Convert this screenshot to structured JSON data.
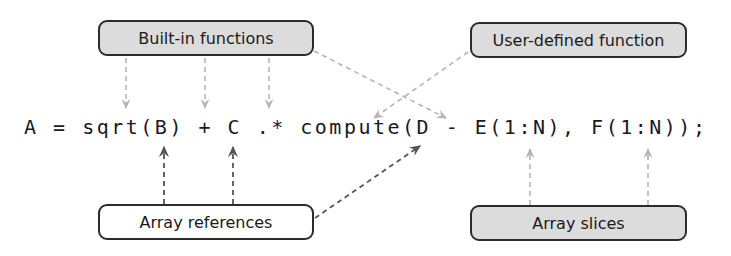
{
  "diagram": {
    "code_line": "A = sqrt(B) + C .* compute(D - E(1:N), F(1:N));",
    "labels": {
      "builtin": "Built-in functions",
      "userdef": "User-defined function",
      "arrayref": "Array references",
      "slices": "Array slices"
    },
    "annotations": [
      {
        "label": "Built-in functions",
        "targets": [
          "sqrt",
          "+",
          ".*",
          "-"
        ],
        "arrow_style": "light-dashed"
      },
      {
        "label": "User-defined function",
        "targets": [
          "compute"
        ],
        "arrow_style": "light-dashed"
      },
      {
        "label": "Array references",
        "targets": [
          "B",
          "C",
          "D"
        ],
        "arrow_style": "dark-dashed"
      },
      {
        "label": "Array slices",
        "targets": [
          "E(1:N)",
          "F(1:N)"
        ],
        "arrow_style": "light-dashed"
      }
    ],
    "colors": {
      "box_fill_gray": "#dcdcdc",
      "box_fill_white": "#ffffff",
      "box_border": "#2b2b2b",
      "arrow_light": "#b5b5b5",
      "arrow_dark": "#555555",
      "text": "#1a1a1a"
    }
  }
}
